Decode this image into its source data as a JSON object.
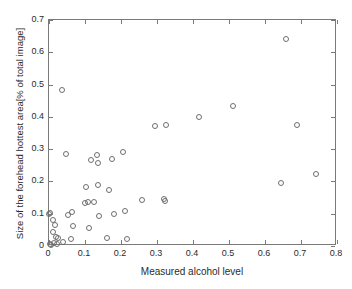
{
  "chart_data": {
    "type": "scatter",
    "title": "",
    "xlabel": "Measured alcohol level",
    "ylabel": "Size of the forehead hottest area[% of total image]",
    "xlim": [
      0,
      0.8
    ],
    "ylim": [
      0,
      0.7
    ],
    "xticks": [
      "0",
      "0.1",
      "0.2",
      "0.3",
      "0.4",
      "0.5",
      "0.6",
      "0.7",
      "0.8"
    ],
    "xtick_values": [
      0,
      0.1,
      0.2,
      0.3,
      0.4,
      0.5,
      0.6,
      0.7,
      0.8
    ],
    "yticks": [
      "0",
      "0.1",
      "0.2",
      "0.3",
      "0.4",
      "0.5",
      "0.6",
      "0.7"
    ],
    "ytick_values": [
      0,
      0.1,
      0.2,
      0.3,
      0.4,
      0.5,
      0.6,
      0.7
    ],
    "grid": false,
    "legend": null,
    "marker": "open-circle",
    "marker_color": "#6e6e6e",
    "series": [
      {
        "name": "subjects",
        "points": [
          [
            0.0,
            0.1
          ],
          [
            0.002,
            0.101
          ],
          [
            0.003,
            0.006
          ],
          [
            0.006,
            0.004
          ],
          [
            0.01,
            0.082
          ],
          [
            0.012,
            0.044
          ],
          [
            0.013,
            0.008
          ],
          [
            0.018,
            0.066
          ],
          [
            0.02,
            0.029
          ],
          [
            0.021,
            0.005
          ],
          [
            0.024,
            0.025
          ],
          [
            0.036,
            0.483
          ],
          [
            0.04,
            0.012
          ],
          [
            0.048,
            0.286
          ],
          [
            0.053,
            0.096
          ],
          [
            0.06,
            0.021
          ],
          [
            0.063,
            0.105
          ],
          [
            0.068,
            0.062
          ],
          [
            0.1,
            0.134
          ],
          [
            0.103,
            0.182
          ],
          [
            0.107,
            0.137
          ],
          [
            0.112,
            0.056
          ],
          [
            0.118,
            0.265
          ],
          [
            0.125,
            0.136
          ],
          [
            0.133,
            0.283
          ],
          [
            0.136,
            0.19
          ],
          [
            0.137,
            0.258
          ],
          [
            0.14,
            0.092
          ],
          [
            0.16,
            0.026
          ],
          [
            0.167,
            0.174
          ],
          [
            0.176,
            0.27
          ],
          [
            0.18,
            0.1
          ],
          [
            0.206,
            0.291
          ],
          [
            0.21,
            0.107
          ],
          [
            0.216,
            0.022
          ],
          [
            0.258,
            0.144
          ],
          [
            0.294,
            0.372
          ],
          [
            0.32,
            0.147
          ],
          [
            0.322,
            0.14
          ],
          [
            0.325,
            0.374
          ],
          [
            0.417,
            0.4
          ],
          [
            0.51,
            0.434
          ],
          [
            0.645,
            0.196
          ],
          [
            0.658,
            0.64
          ],
          [
            0.688,
            0.375
          ],
          [
            0.742,
            0.223
          ]
        ]
      }
    ]
  }
}
